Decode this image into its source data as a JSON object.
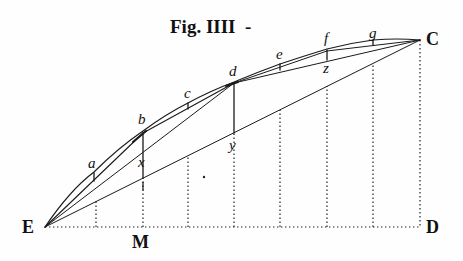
{
  "figure": {
    "title": "Fig. IIII",
    "title_suffix": "-",
    "ink_color": "#1a1a1a",
    "background": "#fefefe"
  },
  "points": {
    "E": {
      "label": "E",
      "x": 45,
      "y": 227
    },
    "M": {
      "label": "M",
      "x": 143,
      "y": 227
    },
    "D": {
      "label": "D",
      "x": 420,
      "y": 227
    },
    "C": {
      "label": "C",
      "x": 420,
      "y": 40
    },
    "b": {
      "label": "b",
      "x": 143,
      "y": 133
    },
    "d": {
      "label": "d",
      "x": 234,
      "y": 83
    },
    "x": {
      "label": "x",
      "x": 143,
      "y": 178
    },
    "y": {
      "label": "y",
      "x": 234,
      "y": 133
    },
    "z": {
      "label": "z",
      "x": 327,
      "y": 56
    },
    "a": {
      "label": "a",
      "x": 94,
      "y": 178
    },
    "c": {
      "label": "c",
      "x": 188,
      "y": 105
    },
    "e": {
      "label": "e",
      "x": 280,
      "y": 68
    },
    "f": {
      "label": "f",
      "x": 327,
      "y": 48
    },
    "g": {
      "label": "g",
      "x": 373,
      "y": 41
    }
  },
  "labels": {
    "E": "E",
    "M": "M",
    "D": "D",
    "C": "C",
    "a": "a",
    "b": "b",
    "c": "c",
    "d": "d",
    "e": "e",
    "f": "f",
    "g": "g",
    "x": "x",
    "y": "y",
    "z": "z"
  },
  "dotted_verticals_x": [
    96,
    143,
    188,
    280,
    327,
    373,
    420
  ]
}
